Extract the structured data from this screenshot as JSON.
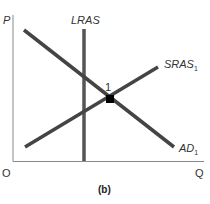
{
  "diagram": {
    "caption": "(b)",
    "axes": {
      "y_label": "P",
      "x_label": "Q",
      "origin_label": "O"
    },
    "curves": {
      "lras": {
        "label": "LRAS"
      },
      "sras": {
        "label": "SRAS",
        "subscript": "1"
      },
      "ad": {
        "label": "AD",
        "subscript": "1"
      }
    },
    "equilibrium": {
      "label": "1"
    },
    "colors": {
      "axis": "#888888",
      "curve": "#444444",
      "point": "#000000"
    }
  }
}
